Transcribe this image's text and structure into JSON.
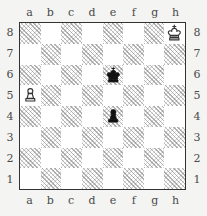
{
  "diagram": {
    "board_size": 8,
    "colors": {
      "background": "#f4f4f2",
      "light_square": "#ffffff",
      "dark_square_hatch": "#787878",
      "border": "#333333",
      "label_text": "#4a4a4a",
      "white_piece_fill": "#ffffff",
      "white_piece_stroke": "#333333",
      "black_piece_fill": "#111111"
    }
  },
  "coordinates": {
    "files_top": [
      "a",
      "b",
      "c",
      "d",
      "e",
      "f",
      "g",
      "h"
    ],
    "files_bottom": [
      "a",
      "b",
      "c",
      "d",
      "e",
      "f",
      "g",
      "h"
    ],
    "ranks_left": [
      "8",
      "7",
      "6",
      "5",
      "4",
      "3",
      "2",
      "1"
    ],
    "ranks_right": [
      "8",
      "7",
      "6",
      "5",
      "4",
      "3",
      "2",
      "1"
    ]
  },
  "chart_data": {
    "type": "table",
    "xlabel": "files a-h",
    "ylabel": "ranks 1-8",
    "categories": [
      "a",
      "b",
      "c",
      "d",
      "e",
      "f",
      "g",
      "h"
    ],
    "pieces": [
      {
        "square": "h8",
        "file": "h",
        "rank": 8,
        "color": "white",
        "type": "king",
        "glyph": "♔",
        "label": "White King h8"
      },
      {
        "square": "e6",
        "file": "e",
        "rank": 6,
        "color": "black",
        "type": "king",
        "glyph": "♚",
        "label": "Black King e6"
      },
      {
        "square": "a5",
        "file": "a",
        "rank": 5,
        "color": "white",
        "type": "pawn",
        "glyph": "♙",
        "label": "White Pawn a5"
      },
      {
        "square": "e4",
        "file": "e",
        "rank": 4,
        "color": "black",
        "type": "pawn",
        "glyph": "♟",
        "label": "Black Pawn e4"
      }
    ],
    "dark_squares_note": "a1 dark; dark squares carry a diagonal hatch fill",
    "fen": "7K/8/4k3/P7/4p3/8/8/8"
  }
}
